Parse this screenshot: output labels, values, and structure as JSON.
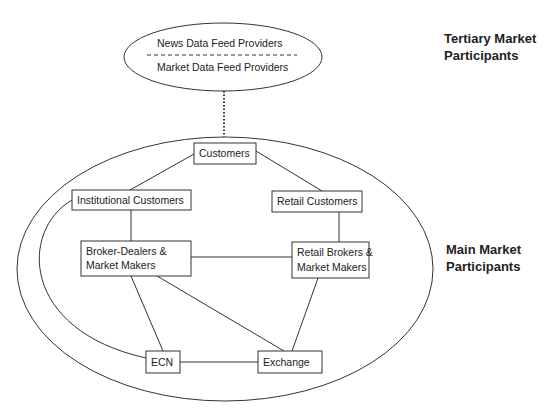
{
  "tertiary": {
    "label_line1": "Tertiary Market",
    "label_line2": "Participants",
    "providers": [
      "News Data Feed Providers",
      "Market Data Feed Providers"
    ]
  },
  "main": {
    "label_line1": "Main Market",
    "label_line2": "Participants"
  },
  "nodes": {
    "customers": "Customers",
    "institutional_customers": "Institutional Customers",
    "retail_customers": "Retail Customers",
    "broker_dealers_1": "Broker-Dealers &",
    "broker_dealers_2": "Market Makers",
    "retail_brokers_1": "Retail Brokers &",
    "retail_brokers_2": "Market Makers",
    "ecn": "ECN",
    "exchange": "Exchange"
  },
  "colors": {
    "stroke": "#333333",
    "text": "#222222",
    "background": "#ffffff"
  }
}
